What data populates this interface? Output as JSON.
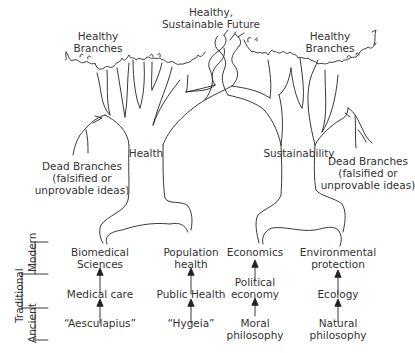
{
  "diagram": {
    "top_label": "Healthy,\nSustainable Future",
    "top_label_lines": [
      "Healthy,",
      "Sustainable Future"
    ],
    "trees": [
      {
        "name": "Health",
        "trunk_label": "Health",
        "healthy_branches": [
          "Healthy",
          "Branches"
        ],
        "dead_branches": [
          "Dead Branches",
          "(falsified or",
          "unprovable ideas)"
        ]
      },
      {
        "name": "Sustainability",
        "trunk_label": "Sustainability",
        "healthy_branches": [
          "Healthy",
          "Branches"
        ],
        "dead_branches": [
          "Dead Branches",
          "(falsified or",
          "unprovable ideas)"
        ]
      }
    ],
    "era_bracket": {
      "outer": "Traditional",
      "modern": "Modern",
      "ancient": "Ancient"
    },
    "roots": [
      {
        "modern": [
          "Biomedical",
          "Sciences"
        ],
        "middle": [
          "Medical care"
        ],
        "ancient": [
          "“Aesculapius”"
        ]
      },
      {
        "modern": [
          "Population",
          "health"
        ],
        "middle": [
          "Public Health"
        ],
        "ancient": [
          "“Hygeia”"
        ]
      },
      {
        "modern": [
          "Economics"
        ],
        "middle": [
          "Political",
          "economy"
        ],
        "ancient": [
          "Moral",
          "philosophy"
        ]
      },
      {
        "modern": [
          "Environmental",
          "protection"
        ],
        "middle": [
          "Ecology"
        ],
        "ancient": [
          "Natural",
          "philosophy"
        ]
      }
    ],
    "colors": {
      "line": "#222222",
      "text": "#333333",
      "background": "#ffffff"
    }
  }
}
